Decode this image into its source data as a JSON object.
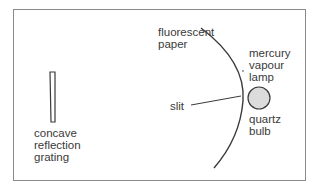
{
  "diagram": {
    "labels": {
      "fluorescent_paper": "fluorescent\npaper",
      "mercury_lamp": "mercury\nvapour\nlamp",
      "slit": "slit",
      "quartz_bulb": "quartz\nbulb",
      "grating": "concave\nreflection\ngrating"
    },
    "colors": {
      "line": "#3a3a3a",
      "border": "#8a8a8a",
      "bulb_fill": "#dcdcdc",
      "grating_fill": "#ffffff"
    }
  }
}
